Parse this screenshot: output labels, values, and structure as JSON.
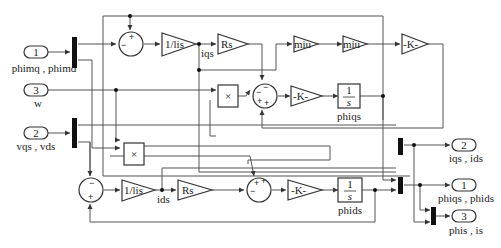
{
  "diagram": {
    "type": "simulink-block-diagram",
    "inports": [
      {
        "number": "1",
        "label": "phimq , phimd"
      },
      {
        "number": "3",
        "label": "w"
      },
      {
        "number": "2",
        "label": "vqs , vds"
      }
    ],
    "outports": [
      {
        "number": "2",
        "label": "iqs , ids"
      },
      {
        "number": "1",
        "label": "phiqs , phids"
      },
      {
        "number": "3",
        "label": "phis , is"
      }
    ],
    "gains": {
      "q_inv_lis": "1/lis",
      "q_rs": "Rs",
      "miu1": "miu",
      "miu2": "miu",
      "k_top": "-K-",
      "k_q": "-K-",
      "d_inv_lis": "1/lis",
      "d_rs": "Rs",
      "k_d": "-K-"
    },
    "integrators": {
      "q": {
        "num": "1",
        "den": "s",
        "label": "phiqs"
      },
      "d": {
        "num": "1",
        "den": "s",
        "label": "phids"
      }
    },
    "products": {
      "p1": "×",
      "p2": "×"
    },
    "signals": {
      "iqs": "iqs",
      "ids": "ids"
    },
    "sum_signs": {
      "sum_q1": {
        "top": "+",
        "left": "−"
      },
      "sum_q2": {
        "top": "−",
        "left": "−",
        "bl": "+",
        "br": "+"
      },
      "sum_d1": {
        "top": "−",
        "bottom": "+"
      },
      "sum_d2": {
        "tl": "+",
        "tr": "+",
        "left": "−"
      }
    }
  }
}
